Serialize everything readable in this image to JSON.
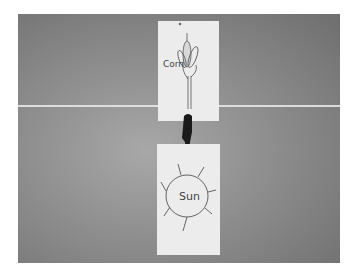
{
  "scene": {
    "description": "Grayscale photo of two paper picture cards on a gray board with a dark arrow between them",
    "background_color": "#8e8e8e",
    "card_color": "#ececec",
    "arrow_color": "#1a1a1a"
  },
  "cards": [
    {
      "label": "Corn",
      "drawing": "corn-plant"
    },
    {
      "label": "Sun",
      "drawing": "sun"
    }
  ],
  "arrow": {
    "direction": "down"
  }
}
